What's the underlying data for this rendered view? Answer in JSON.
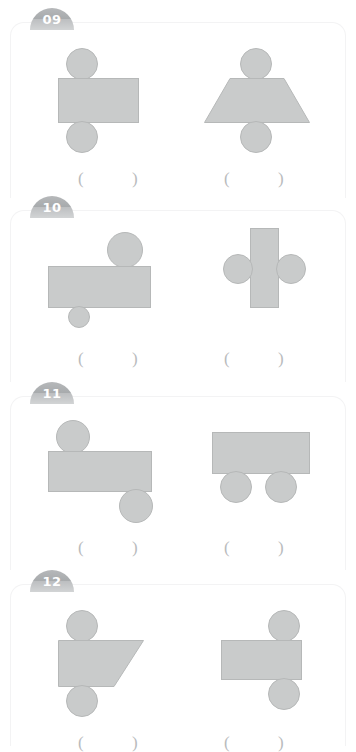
{
  "worksheet": {
    "title": "Geometry shape composition worksheet",
    "shape_fill": "#c9cbcb",
    "shape_stroke": "#b6b8b8",
    "badge_color": "#a8abad",
    "paren_color": "#b9bbbd",
    "answer_open": "(",
    "answer_close": ")"
  },
  "panels": [
    {
      "number": "09",
      "top": 8,
      "height": 190,
      "items": [
        {
          "name": "rectangle-with-circles-above-and-below",
          "answer": "",
          "paren_left": 68,
          "paren_right": 122,
          "paren_top": 148
        },
        {
          "name": "trapezoid-with-circles-above-and-below",
          "answer": "",
          "paren_left": 214,
          "paren_right": 268,
          "paren_top": 148
        }
      ]
    },
    {
      "number": "10",
      "top": 196,
      "height": 186,
      "items": [
        {
          "name": "rectangle-with-large-circle-top-right-and-small-circle-below-left",
          "answer": "",
          "paren_left": 68,
          "paren_right": 122,
          "paren_top": 140
        },
        {
          "name": "vertical-rectangle-with-circles-on-both-sides",
          "answer": "",
          "paren_left": 214,
          "paren_right": 268,
          "paren_top": 140
        }
      ]
    },
    {
      "number": "11",
      "top": 382,
      "height": 188,
      "items": [
        {
          "name": "rectangle-with-circle-top-left-and-circle-bottom-right",
          "answer": "",
          "paren_left": 68,
          "paren_right": 122,
          "paren_top": 143
        },
        {
          "name": "rectangle-with-two-circles-below",
          "answer": "",
          "paren_left": 214,
          "paren_right": 268,
          "paren_top": 143
        }
      ]
    },
    {
      "number": "12",
      "top": 570,
      "height": 176,
      "items": [
        {
          "name": "right-trapezoid-with-circles-above-and-below-left",
          "answer": "",
          "paren_left": 68,
          "paren_right": 122,
          "paren_top": 150
        },
        {
          "name": "rectangle-with-circles-above-and-below-right",
          "answer": "",
          "paren_left": 214,
          "paren_right": 268,
          "paren_top": 150
        }
      ]
    }
  ]
}
